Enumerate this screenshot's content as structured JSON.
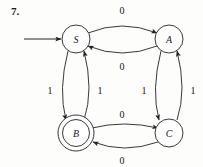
{
  "figure": {
    "exercise_number": "7.",
    "type": "finite-state-machine",
    "alphabet": [
      "0",
      "1"
    ],
    "start_state": "S",
    "accepting_states": [
      "B"
    ]
  },
  "states": [
    {
      "id": "S",
      "label": "S",
      "accepting": false,
      "start": true,
      "cx": 76,
      "cy": 39
    },
    {
      "id": "A",
      "label": "A",
      "accepting": false,
      "start": false,
      "cx": 169,
      "cy": 39
    },
    {
      "id": "B",
      "label": "B",
      "accepting": true,
      "start": false,
      "cx": 76,
      "cy": 133
    },
    {
      "id": "C",
      "label": "C",
      "accepting": false,
      "start": false,
      "cx": 169,
      "cy": 133
    }
  ],
  "transitions": [
    {
      "id": "s-to-a",
      "from": "S",
      "to": "A",
      "input": "0",
      "label_x": 122,
      "label_y": 18
    },
    {
      "id": "a-to-s",
      "from": "A",
      "to": "S",
      "input": "0",
      "label_x": 122,
      "label_y": 63
    },
    {
      "id": "s-to-b",
      "from": "S",
      "to": "B",
      "input": "1",
      "label_x": 55,
      "label_y": 90
    },
    {
      "id": "b-to-s",
      "from": "B",
      "to": "S",
      "input": "1",
      "label_x": 93,
      "label_y": 90
    },
    {
      "id": "a-to-c",
      "from": "A",
      "to": "C",
      "input": "1",
      "label_x": 150,
      "label_y": 90
    },
    {
      "id": "c-to-a",
      "from": "C",
      "to": "A",
      "input": "1",
      "label_x": 188,
      "label_y": 90
    },
    {
      "id": "b-to-c",
      "from": "B",
      "to": "C",
      "input": "0",
      "label_x": 122,
      "label_y": 115
    },
    {
      "id": "c-to-b",
      "from": "C",
      "to": "B",
      "input": "0",
      "label_x": 122,
      "label_y": 161
    }
  ],
  "colors": {
    "ink": "#232323",
    "text": "#151515",
    "background": "#fdfdfc"
  }
}
